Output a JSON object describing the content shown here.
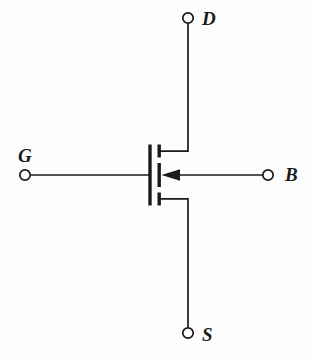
{
  "figure": {
    "kind": "circuit-schematic",
    "device": "n-channel-mosfet-four-terminal",
    "background_color": "#fdfdfd",
    "line_color": "#1a1a1a",
    "label_color": "#1a1a1a"
  },
  "terminals": {
    "drain": {
      "label": "D",
      "node_x": 188,
      "node_y": 18,
      "label_x": 202,
      "label_y": 9
    },
    "gate": {
      "label": "G",
      "node_x": 25,
      "node_y": 175,
      "label_x": 18,
      "label_y": 146
    },
    "body": {
      "label": "B",
      "node_x": 268,
      "node_y": 175,
      "label_x": 285,
      "label_y": 165
    },
    "source": {
      "label": "S",
      "node_x": 188,
      "node_y": 333,
      "label_x": 202,
      "label_y": 325
    }
  },
  "geometry": {
    "gate_bar": {
      "x": 150,
      "y_top": 145,
      "y_bottom": 205
    },
    "channel_segments": [
      {
        "name": "drain-segment",
        "x": 159,
        "y_top": 145,
        "y_bottom": 157
      },
      {
        "name": "body-segment",
        "x": 159,
        "y_top": 163,
        "y_bottom": 187
      },
      {
        "name": "source-segment",
        "x": 159,
        "y_top": 193,
        "y_bottom": 205
      }
    ],
    "drain_lead": {
      "from_x": 159,
      "from_y": 151,
      "corner_x": 188,
      "to_y": 18
    },
    "source_lead": {
      "from_x": 159,
      "from_y": 199,
      "corner_x": 188,
      "to_y": 333
    },
    "gate_lead": {
      "from_x": 25,
      "to_x": 150,
      "y": 175
    },
    "body_lead": {
      "from_x": 268,
      "to_x": 161,
      "y": 175,
      "arrow": "left"
    },
    "node_radius": 5.2,
    "stroke_width_lead": 1.6,
    "stroke_width_bar": 3.4
  }
}
